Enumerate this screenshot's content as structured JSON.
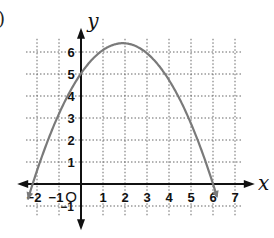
{
  "fragment_label": ")",
  "chart_data": {
    "type": "line",
    "title": "",
    "xlabel": "x",
    "ylabel": "y",
    "xlim": [
      -2.5,
      7.5
    ],
    "ylim": [
      -1.5,
      6.8
    ],
    "grid": true,
    "grid_style": "dotted",
    "origin_label": "O",
    "x_ticks": [
      -2,
      -1,
      1,
      2,
      3,
      4,
      5,
      6,
      7
    ],
    "x_tick_labels": [
      "−2",
      "−1",
      "1",
      "2",
      "3",
      "4",
      "5",
      "6",
      "7"
    ],
    "y_ticks": [
      -1,
      1,
      2,
      3,
      4,
      5,
      6
    ],
    "y_tick_labels": [
      "−1",
      "1",
      "2",
      "3",
      "4",
      "5",
      "6"
    ],
    "series": [
      {
        "name": "parabola",
        "description": "downward-opening parabola with arrowheads at both ends",
        "roots": [
          -2.2,
          6.0
        ],
        "vertex": [
          1.9,
          6.4
        ],
        "y_intercept": 5.5,
        "x": [
          -2.4,
          -2.2,
          -2,
          -1,
          0,
          1,
          1.9,
          3,
          4,
          5,
          6,
          6.2
        ],
        "y": [
          -1.0,
          0,
          0.9,
          4.0,
          5.5,
          6.2,
          6.4,
          6.1,
          5.1,
          3.2,
          0,
          -0.6
        ],
        "color": "#777777"
      }
    ]
  },
  "colors": {
    "axis": "#111111",
    "grid": "#666666",
    "curve": "#7a7a7a",
    "text": "#111111"
  }
}
